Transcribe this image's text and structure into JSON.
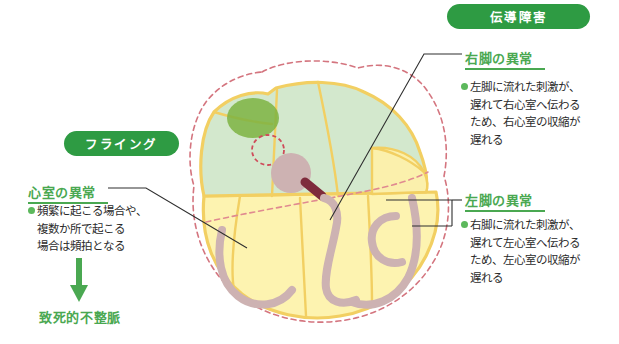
{
  "diagram": {
    "title_badges": {
      "conduction": "伝導障害",
      "flying": "フライング"
    },
    "annotations": {
      "ventricle": {
        "heading": "心室の異常",
        "lines": [
          "頻繁に起こる場合や、",
          "複数か所で起こる",
          "場合は頻拍となる"
        ],
        "outcome": "致死的不整脈",
        "arrow_icon": "arrow-down-icon"
      },
      "right_bundle": {
        "heading": "右脚の異常",
        "lines": [
          "左脚に流れた刺激が、",
          "遅れて右心室へ伝わる",
          "ため、右心室の収縮が",
          "遅れる"
        ]
      },
      "left_bundle": {
        "heading": "左脚の異常",
        "lines": [
          "右脚に流れた刺激が、",
          "遅れて左心室へ伝わる",
          "ため、左心室の収縮が",
          "遅れる"
        ]
      }
    },
    "colors": {
      "badge_green": "#2e9b43",
      "heading_green": "#4aa851",
      "bullet_green": "#5cb85c",
      "arrow_green": "#4aa851",
      "atrium_green": "#cfe6cb",
      "ventricle_yellow": "#fbf0ac",
      "wall_gold": "#f2cf62",
      "dashed_red": "#d4757f",
      "bundle_mauve": "#cdb2b2",
      "node_dark_green": "#7cb342",
      "av_node_mauve": "#cdb2b2",
      "his_dark_red": "#7e2b3c",
      "leader_line": "#2f2f2f"
    },
    "heart_parts": {
      "sa_node": "sa-node-marker",
      "ectopic_focus": "ectopic-focus-marker",
      "av_node": "av-node-marker",
      "his_bundle": "his-bundle-marker",
      "right_bundle_branch": "right-bundle-branch",
      "left_bundle_branch": "left-bundle-branch",
      "purkinje_fibers": "purkinje-fiber-network",
      "outer_dashed_outline": "heart-dashed-outline"
    }
  }
}
